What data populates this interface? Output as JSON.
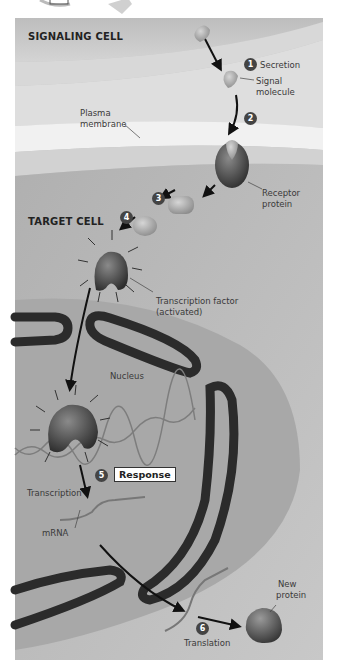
{
  "diagram": {
    "type": "cell-signaling-pathway",
    "regions": {
      "signaling_cell": "SIGNALING CELL",
      "target_cell": "TARGET CELL"
    },
    "labels": {
      "plasma_membrane": "Plasma\nmembrane",
      "plasma_membrane_l1": "Plasma",
      "plasma_membrane_l2": "membrane",
      "signal_molecule_l1": "Signal",
      "signal_molecule_l2": "molecule",
      "receptor_l1": "Receptor",
      "receptor_l2": "protein",
      "tf_l1": "Transcription factor",
      "tf_l2": "(activated)",
      "nucleus": "Nucleus",
      "transcription": "Transcription",
      "mrna": "mRNA",
      "new_protein_l1": "New",
      "new_protein_l2": "protein",
      "translation": "Translation",
      "response": "Response"
    },
    "steps": [
      {
        "n": "1",
        "label": "Secretion"
      },
      {
        "n": "2",
        "label": ""
      },
      {
        "n": "3",
        "label": ""
      },
      {
        "n": "4",
        "label": ""
      },
      {
        "n": "5",
        "label": "Response"
      },
      {
        "n": "6",
        "label": "Translation"
      }
    ],
    "colors": {
      "signaling_cell": "#c9c9c9",
      "membrane_light": "#eeeeee",
      "target_cell": "#b8b8b8",
      "nucleus": "#aaaaaa",
      "nuclear_envelope": "#2e2e2e",
      "molecule": "#9a9a9a",
      "receptor": "#4a4a4a",
      "badge": "#444444"
    }
  }
}
